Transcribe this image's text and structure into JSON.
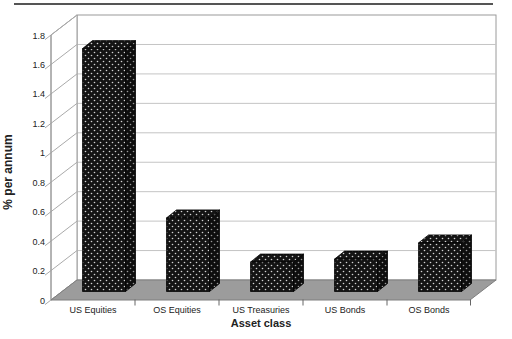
{
  "figure": {
    "kind": "excel-style-3d-column-chart",
    "title": "",
    "legend": "none"
  },
  "chart_data": {
    "type": "bar",
    "variant": "3d-column",
    "categories": [
      "US Equities",
      "OS Equities",
      "US Treasuries",
      "US Bonds",
      "OS Bonds"
    ],
    "values": [
      1.65,
      0.5,
      0.2,
      0.22,
      0.33
    ],
    "xlabel": "Asset class",
    "ylabel": "% per annum",
    "yticks": [
      0,
      0.2,
      0.4,
      0.6,
      0.8,
      1,
      1.2,
      1.4,
      1.6,
      1.8
    ],
    "ytick_labels": [
      "0",
      "0.2",
      "0.4",
      "0.6",
      "0.8",
      "1",
      "1.2",
      "1.4",
      "1.6",
      "1.8"
    ],
    "ylim": [
      0,
      1.8
    ],
    "grid": true,
    "legend": "none",
    "colors": {
      "bar_fill": "#141414",
      "bar_dot": "#e8e8e8",
      "bar_edge": "#000000",
      "floor": "#9c9c9c",
      "floor_edge": "#7e7e7e",
      "wall_fill": "#ffffff",
      "wall_grid": "#c4c4c4",
      "wall_border": "#9a9a9a",
      "tick": "#666666",
      "text": "#222222",
      "top_rule": "#555555"
    }
  }
}
